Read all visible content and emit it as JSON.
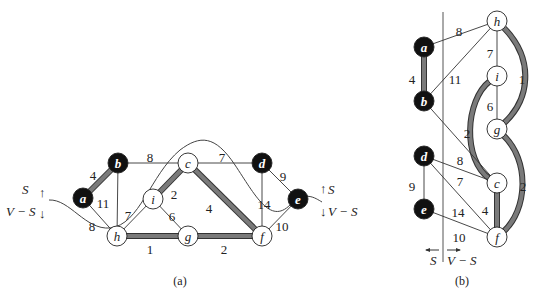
{
  "colors": {
    "mst_edge": "#7a7a7a",
    "mst_edge_outline": "#333333",
    "edge": "#333333",
    "node_s_fill": "#111111",
    "node_vs_fill": "#ffffff"
  },
  "panel_a": {
    "caption": "(a)",
    "nodes": [
      {
        "id": "a",
        "label": "a",
        "x": 83,
        "y": 198,
        "in_S": true
      },
      {
        "id": "b",
        "label": "b",
        "x": 118,
        "y": 163,
        "in_S": true
      },
      {
        "id": "c",
        "label": "c",
        "x": 188,
        "y": 163,
        "in_S": false
      },
      {
        "id": "d",
        "label": "d",
        "x": 262,
        "y": 163,
        "in_S": true
      },
      {
        "id": "e",
        "label": "e",
        "x": 298,
        "y": 199,
        "in_S": true
      },
      {
        "id": "i",
        "label": "i",
        "x": 153,
        "y": 199,
        "in_S": false
      },
      {
        "id": "h",
        "label": "h",
        "x": 117,
        "y": 236,
        "in_S": false
      },
      {
        "id": "g",
        "label": "g",
        "x": 188,
        "y": 236,
        "in_S": false
      },
      {
        "id": "f",
        "label": "f",
        "x": 262,
        "y": 236,
        "in_S": false
      }
    ],
    "edges": [
      {
        "from": "a",
        "to": "b",
        "weight": "4",
        "mst": true,
        "lx": 93,
        "ly": 175
      },
      {
        "from": "b",
        "to": "c",
        "weight": "8",
        "mst": false,
        "lx": 150,
        "ly": 157
      },
      {
        "from": "c",
        "to": "d",
        "weight": "7",
        "mst": false,
        "lx": 222,
        "ly": 157
      },
      {
        "from": "d",
        "to": "e",
        "weight": "9",
        "mst": false,
        "lx": 283,
        "ly": 176
      },
      {
        "from": "a",
        "to": "h",
        "weight": "8",
        "mst": false,
        "lx": 92,
        "ly": 226
      },
      {
        "from": "b",
        "to": "h",
        "weight": "11",
        "mst": false,
        "lx": 103,
        "ly": 203
      },
      {
        "from": "c",
        "to": "i",
        "weight": "2",
        "mst": true,
        "lx": 174,
        "ly": 194
      },
      {
        "from": "c",
        "to": "f",
        "weight": "4",
        "mst": true,
        "lx": 209,
        "ly": 208
      },
      {
        "from": "i",
        "to": "h",
        "weight": "7",
        "mst": false,
        "lx": 128,
        "ly": 215
      },
      {
        "from": "i",
        "to": "g",
        "weight": "6",
        "mst": false,
        "lx": 172,
        "ly": 216
      },
      {
        "from": "h",
        "to": "g",
        "weight": "1",
        "mst": true,
        "lx": 150,
        "ly": 249
      },
      {
        "from": "g",
        "to": "f",
        "weight": "2",
        "mst": true,
        "lx": 224,
        "ly": 249
      },
      {
        "from": "d",
        "to": "f",
        "weight": "14",
        "mst": false,
        "lx": 264,
        "ly": 204
      },
      {
        "from": "e",
        "to": "f",
        "weight": "10",
        "mst": false,
        "lx": 282,
        "ly": 226
      }
    ],
    "cut_labels": {
      "left_S": "S",
      "left_VS": "V − S",
      "right_S": "S",
      "right_VS": "V − S"
    }
  },
  "panel_b": {
    "caption": "(b)",
    "divider_labels": {
      "left": "S",
      "right": "V − S"
    },
    "nodes": [
      {
        "id": "h",
        "label": "h",
        "x": 497,
        "y": 21,
        "in_S": false
      },
      {
        "id": "a",
        "label": "a",
        "x": 424,
        "y": 47,
        "in_S": true
      },
      {
        "id": "i",
        "label": "i",
        "x": 497,
        "y": 76,
        "in_S": false
      },
      {
        "id": "b",
        "label": "b",
        "x": 424,
        "y": 101,
        "in_S": true
      },
      {
        "id": "g",
        "label": "g",
        "x": 497,
        "y": 129,
        "in_S": false
      },
      {
        "id": "d",
        "label": "d",
        "x": 424,
        "y": 156,
        "in_S": true
      },
      {
        "id": "c",
        "label": "c",
        "x": 497,
        "y": 183,
        "in_S": false
      },
      {
        "id": "e",
        "label": "e",
        "x": 424,
        "y": 209,
        "in_S": true
      },
      {
        "id": "f",
        "label": "f",
        "x": 497,
        "y": 237,
        "in_S": false
      }
    ],
    "edges": [
      {
        "from": "a",
        "to": "h",
        "weight": "8",
        "mst": false,
        "lx": 459,
        "ly": 31
      },
      {
        "from": "a",
        "to": "b",
        "weight": "4",
        "mst": true,
        "lx": 412,
        "ly": 79
      },
      {
        "from": "b",
        "to": "h",
        "weight": "11",
        "mst": false,
        "lx": 455,
        "ly": 79
      },
      {
        "from": "h",
        "to": "i",
        "weight": "7",
        "mst": false,
        "lx": 490,
        "ly": 53
      },
      {
        "from": "h",
        "to": "g",
        "weight": "1",
        "mst": true,
        "lx": 522,
        "ly": 79
      },
      {
        "from": "i",
        "to": "g",
        "weight": "6",
        "mst": false,
        "lx": 490,
        "ly": 106
      },
      {
        "from": "i",
        "to": "c",
        "weight": "2",
        "mst": true,
        "lx": 467,
        "ly": 133
      },
      {
        "from": "b",
        "to": "c",
        "weight": "8",
        "mst": false,
        "lx": 460,
        "ly": 160
      },
      {
        "from": "d",
        "to": "c",
        "weight": "7",
        "mst": false,
        "lx": 460,
        "ly": 181
      },
      {
        "from": "d",
        "to": "e",
        "weight": "9",
        "mst": false,
        "lx": 412,
        "ly": 186
      },
      {
        "from": "d",
        "to": "f",
        "weight": "14",
        "mst": false,
        "lx": 458,
        "ly": 212
      },
      {
        "from": "c",
        "to": "f",
        "weight": "4",
        "mst": true,
        "lx": 485,
        "ly": 210
      },
      {
        "from": "g",
        "to": "f",
        "weight": "2",
        "mst": true,
        "lx": 523,
        "ly": 186
      },
      {
        "from": "e",
        "to": "f",
        "weight": "10",
        "mst": false,
        "lx": 459,
        "ly": 237
      }
    ]
  }
}
